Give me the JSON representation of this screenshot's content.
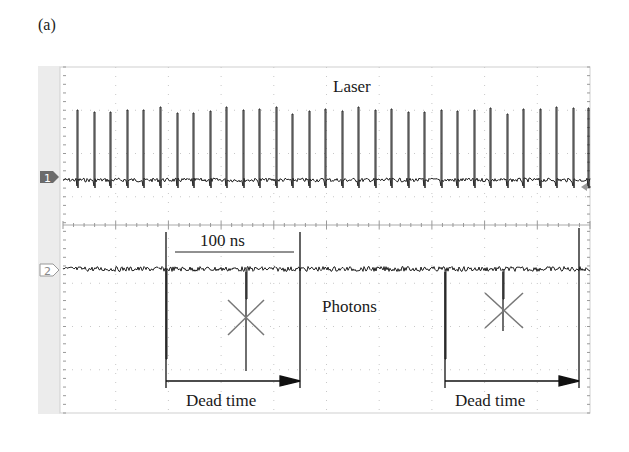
{
  "figure": {
    "panel_label": "(a)",
    "channels": [
      {
        "id": "1",
        "label": "Laser",
        "marker_style": "filled"
      },
      {
        "id": "2",
        "label": "Photons",
        "marker_style": "outline"
      }
    ],
    "annotations": {
      "scale_bar": "100 ns",
      "dead_time_1": "Dead time",
      "dead_time_2": "Dead time"
    }
  },
  "chart_data": {
    "type": "line",
    "title": "",
    "subtitle": "Oscilloscope trace: laser pulses (ch1) and detected photons (ch2)",
    "xlabel": "Time",
    "ylabel": "",
    "grid": true,
    "grid_divisions": {
      "x": 10,
      "y": 8
    },
    "scale_bar": {
      "label": "100 ns",
      "span_divisions": 2.25
    },
    "series": [
      {
        "name": "Laser",
        "channel": 1,
        "kind": "periodic pulse train",
        "pulse_count": 32,
        "pulse_period_divisions": 0.313,
        "pulse_x_px": [
          77,
          94,
          110,
          127,
          143,
          160,
          177,
          193,
          210,
          226,
          243,
          259,
          276,
          292,
          309,
          325,
          342,
          358,
          375,
          391,
          408,
          424,
          441,
          457,
          474,
          490,
          507,
          523,
          540,
          556,
          573,
          588
        ]
      },
      {
        "name": "Photons",
        "channel": 2,
        "kind": "sparse negative pulses",
        "events": [
          {
            "x_px": 166,
            "detected": true
          },
          {
            "x_px": 246,
            "detected": false,
            "note": "crossed out (within dead time)"
          },
          {
            "x_px": 445,
            "detected": true
          },
          {
            "x_px": 503,
            "detected": false,
            "note": "crossed out (within dead time)"
          }
        ],
        "dead_time_windows_px": [
          [
            166,
            300
          ],
          [
            445,
            579
          ]
        ]
      }
    ],
    "legend": [
      "Laser",
      "Photons",
      "Dead time"
    ]
  }
}
